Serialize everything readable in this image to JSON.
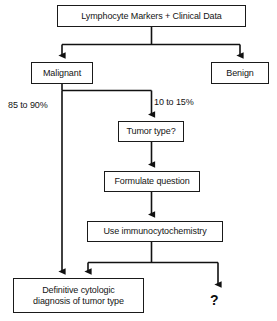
{
  "diagram": {
    "type": "flowchart",
    "line_color": "#1a1a1a",
    "text_color": "#141414",
    "background": "#ffffff",
    "nodes": [
      {
        "id": "root",
        "label": "Lymphocyte Markers + Clinical Data"
      },
      {
        "id": "malignant",
        "label": "Malignant"
      },
      {
        "id": "benign",
        "label": "Benign"
      },
      {
        "id": "tumortype",
        "label": "Tumor type?"
      },
      {
        "id": "formulate",
        "label": "Formulate question"
      },
      {
        "id": "immuno",
        "label": "Use immunocytochemistry"
      },
      {
        "id": "definitive",
        "label_line1": "Definitive cytologic",
        "label_line2": "diagnosis of tumor type"
      }
    ],
    "edge_labels": {
      "left_branch": "85 to 90%",
      "right_branch": "10 to 15%"
    },
    "terminal": {
      "unknown_mark": "?"
    }
  }
}
